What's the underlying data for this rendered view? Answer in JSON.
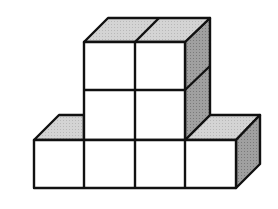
{
  "diagram": {
    "type": "isometric-cube-structure",
    "cube_count": 8,
    "colors": {
      "front": "#ffffff",
      "top": "#cfcfcf",
      "side": "#9a9a9a",
      "stroke": "#111111",
      "background": "#ffffff"
    },
    "layout": {
      "bottom_row_cubes": 4,
      "middle_row_cubes": 2,
      "top_row_cubes": 2
    }
  }
}
